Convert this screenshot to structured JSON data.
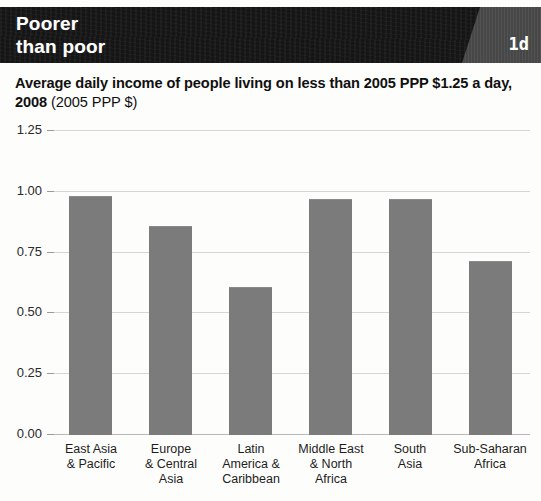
{
  "header": {
    "title": "Poorer\nthan poor",
    "corner_tag": "1d",
    "background_color": "#141414",
    "corner_tag_color": "#4a4a4a"
  },
  "caption": {
    "bold_text": "Average daily income of people living on less than 2005 PPP $1.25 a day, 2008 ",
    "light_text": "(2005 PPP $)"
  },
  "chart_data": {
    "type": "bar",
    "title": "Average daily income of people living on less than 2005 PPP $1.25 a day, 2008 (2005 PPP $)",
    "xlabel": "",
    "ylabel": "",
    "ylim": [
      0,
      1.25
    ],
    "grid": true,
    "legend": "none",
    "bar_color": "#7b7b7b",
    "yticks": [
      "1.25",
      "1.00",
      "0.75",
      "0.50",
      "0.25",
      "0.00"
    ],
    "ytick_values": [
      1.25,
      1.0,
      0.75,
      0.5,
      0.25,
      0.0
    ],
    "categories": [
      "East Asia\n& Pacific",
      "Europe\n& Central\nAsia",
      "Latin\nAmerica &\nCaribbean",
      "Middle East\n& North\nAfrica",
      "South\nAsia",
      "Sub-Saharan\nAfrica"
    ],
    "values": [
      0.98,
      0.855,
      0.605,
      0.965,
      0.965,
      0.71
    ]
  }
}
